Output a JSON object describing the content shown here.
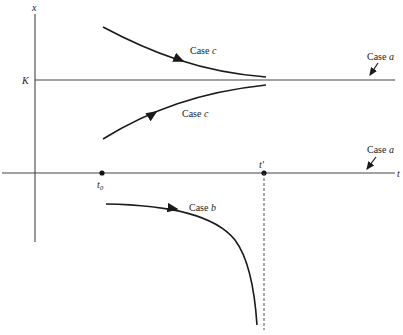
{
  "figure": {
    "axes": {
      "y_label": "x",
      "x_label": "t",
      "level_label": "K",
      "t0_label": "t",
      "t0_subscript": "0",
      "tprime_label": "t′"
    },
    "annotations": {
      "case_c_upper": {
        "text": "Case ",
        "letter": "c"
      },
      "case_c_lower": {
        "text": "Case ",
        "letter": "c"
      },
      "case_a_upper": {
        "text": "Case ",
        "letter": "a"
      },
      "case_a_lower": {
        "text": "Case ",
        "letter": "a"
      },
      "case_b": {
        "text": "Case ",
        "letter": "b"
      }
    },
    "colors": {
      "line": "#1a1a1a",
      "axis": "#444444",
      "background": "#ffffff"
    }
  }
}
